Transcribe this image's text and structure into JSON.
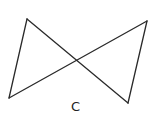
{
  "figure": {
    "label": "C",
    "stroke_color": "#2a2a2a",
    "background": "#ffffff",
    "vertices": {
      "top_left": [
        27,
        19
      ],
      "top_right": [
        147,
        21
      ],
      "bottom_left": [
        9,
        98
      ],
      "bottom_right": [
        128,
        103
      ]
    },
    "segments": [
      {
        "from": "top_left",
        "to": "bottom_left"
      },
      {
        "from": "top_left",
        "to": "bottom_right"
      },
      {
        "from": "bottom_left",
        "to": "top_right"
      },
      {
        "from": "top_right",
        "to": "bottom_right"
      }
    ],
    "intersection": [
      77,
      61
    ]
  }
}
